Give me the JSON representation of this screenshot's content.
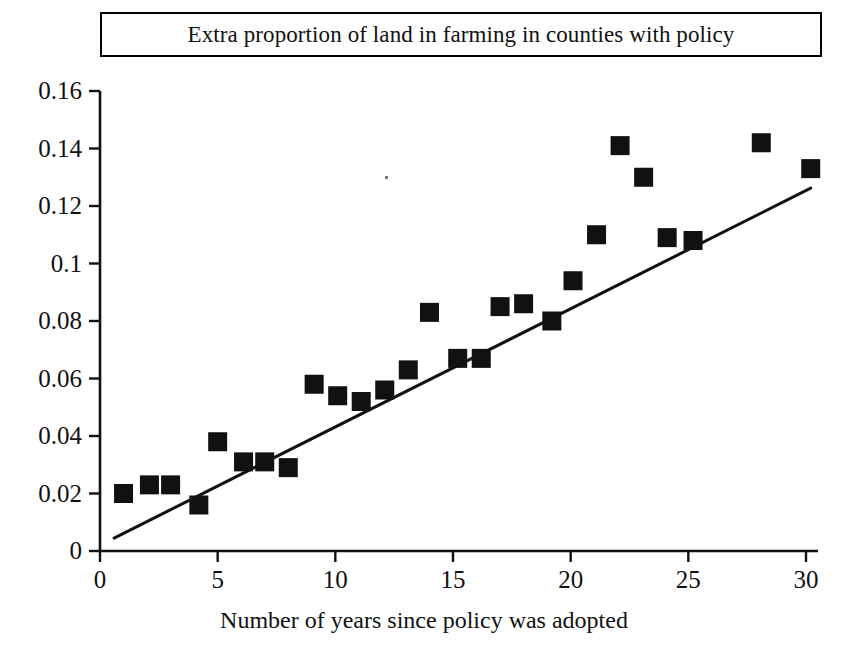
{
  "chart_data": {
    "type": "scatter",
    "title": "Extra proportion of land in farming in counties with policy",
    "xlabel": "Number of years since policy was adopted",
    "ylabel": "",
    "xlim": [
      0,
      30.5
    ],
    "ylim": [
      0,
      0.16
    ],
    "grid": false,
    "legend": null,
    "xticks": [
      "0",
      "5",
      "10",
      "15",
      "20",
      "25",
      "30"
    ],
    "xtick_values": [
      0,
      5,
      10,
      15,
      20,
      25,
      30
    ],
    "yticks": [
      "0",
      "0.02",
      "0.04",
      "0.06",
      "0.08",
      "0.1",
      "0.12",
      "0.14",
      "0.16"
    ],
    "ytick_values": [
      0,
      0.02,
      0.04,
      0.06,
      0.08,
      0.1,
      0.12,
      0.14,
      0.16
    ],
    "marker": "filled-square",
    "marker_color": "#111111",
    "points": [
      {
        "x": 1.0,
        "y": 0.02
      },
      {
        "x": 2.1,
        "y": 0.023
      },
      {
        "x": 3.0,
        "y": 0.023
      },
      {
        "x": 4.2,
        "y": 0.016
      },
      {
        "x": 5.0,
        "y": 0.038
      },
      {
        "x": 6.1,
        "y": 0.031
      },
      {
        "x": 7.0,
        "y": 0.031
      },
      {
        "x": 8.0,
        "y": 0.029
      },
      {
        "x": 9.1,
        "y": 0.058
      },
      {
        "x": 10.1,
        "y": 0.054
      },
      {
        "x": 11.1,
        "y": 0.052
      },
      {
        "x": 12.1,
        "y": 0.056
      },
      {
        "x": 13.1,
        "y": 0.063
      },
      {
        "x": 14.0,
        "y": 0.083
      },
      {
        "x": 15.2,
        "y": 0.067
      },
      {
        "x": 16.2,
        "y": 0.067
      },
      {
        "x": 17.0,
        "y": 0.085
      },
      {
        "x": 18.0,
        "y": 0.086
      },
      {
        "x": 19.2,
        "y": 0.08
      },
      {
        "x": 20.1,
        "y": 0.094
      },
      {
        "x": 21.1,
        "y": 0.11
      },
      {
        "x": 22.1,
        "y": 0.141
      },
      {
        "x": 23.1,
        "y": 0.13
      },
      {
        "x": 24.1,
        "y": 0.109
      },
      {
        "x": 25.2,
        "y": 0.108
      },
      {
        "x": 28.1,
        "y": 0.142
      },
      {
        "x": 30.2,
        "y": 0.133
      }
    ],
    "trendline": {
      "type": "line",
      "color": "#111111",
      "x_start": 0.6,
      "y_start": 0.0045,
      "x_end": 30.2,
      "y_end": 0.1262
    }
  }
}
